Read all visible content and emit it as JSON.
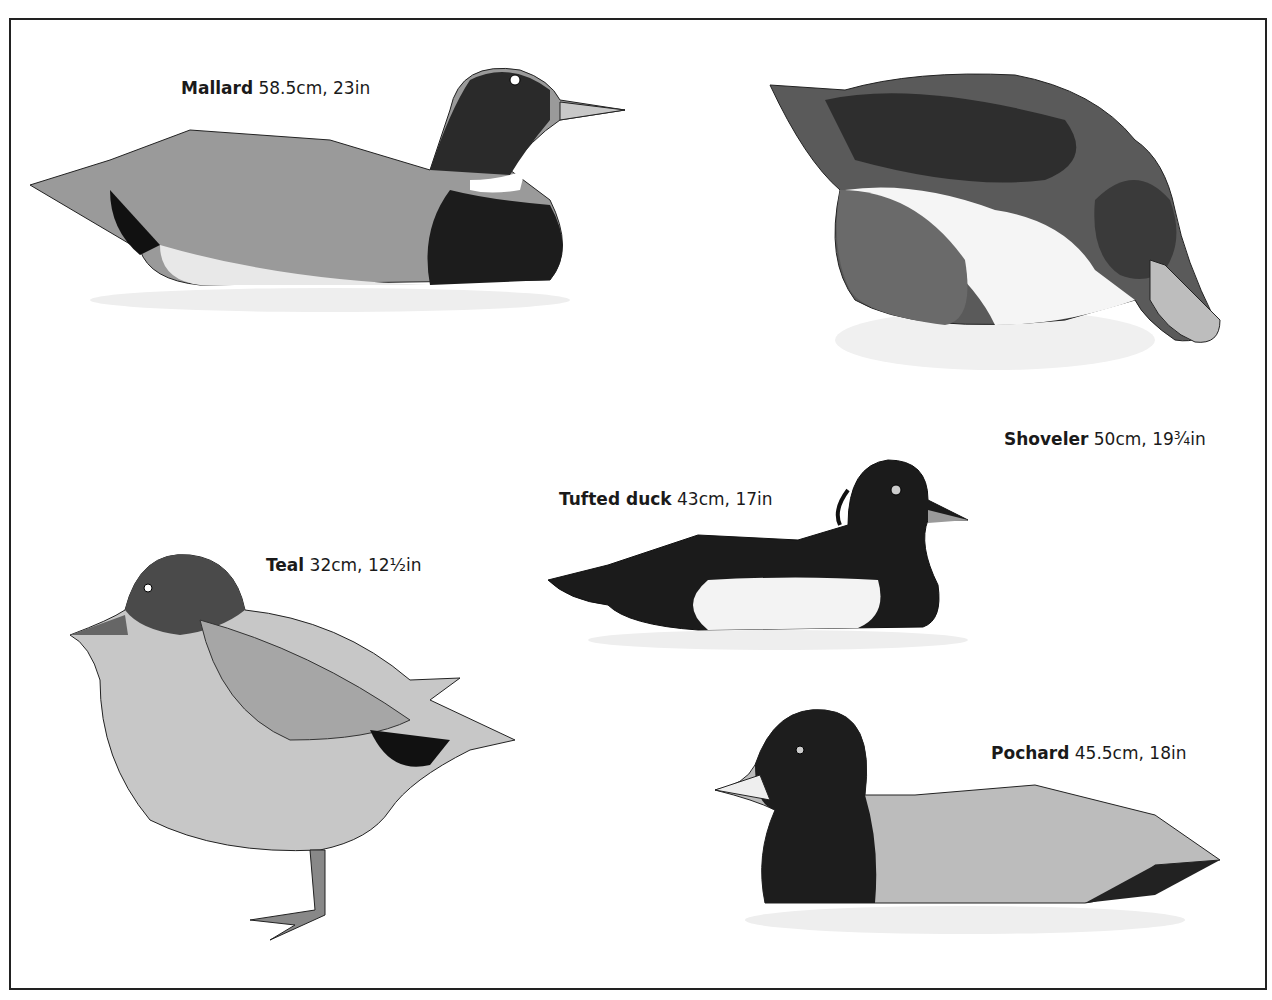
{
  "plate": {
    "birds": [
      {
        "name": "Mallard",
        "measure": "58.5cm, 23in"
      },
      {
        "name": "Shoveler",
        "measure": "50cm, 19¾in"
      },
      {
        "name": "Tufted duck",
        "measure": "43cm, 17in"
      },
      {
        "name": "Teal",
        "measure": "32cm, 12½in"
      },
      {
        "name": "Pochard",
        "measure": "45.5cm, 18in"
      }
    ]
  }
}
